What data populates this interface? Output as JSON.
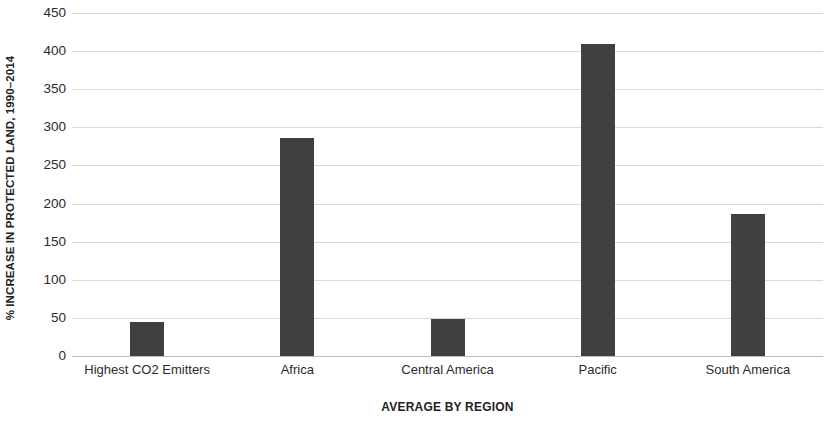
{
  "chart_data": {
    "type": "bar",
    "title": "",
    "subtitle": "",
    "xlabel": "AVERAGE BY REGION",
    "ylabel": "% INCREASE IN PROTECTED LAND, 1990–2014",
    "categories": [
      "Highest CO2 Emitters",
      "Africa",
      "Central America",
      "Pacific",
      "South America"
    ],
    "values": [
      44,
      286,
      48,
      410,
      186
    ],
    "series": [
      {
        "name": "% increase in protected land",
        "values": [
          44,
          286,
          48,
          410,
          186
        ]
      }
    ],
    "ylim": [
      0,
      450
    ],
    "y_ticks": [
      0,
      50,
      100,
      150,
      200,
      250,
      300,
      350,
      400,
      450
    ],
    "y_tick_labels": [
      "0",
      "50",
      "100",
      "150",
      "200",
      "250",
      "300",
      "350",
      "400",
      "450"
    ],
    "y_tick_interval": 50,
    "grid": true,
    "grid_axis": "y",
    "legend": false,
    "legend_position": "none",
    "bar_color": "#404040",
    "gridline_color": "#d9d9d9",
    "background_color": "#ffffff",
    "annotations": []
  }
}
